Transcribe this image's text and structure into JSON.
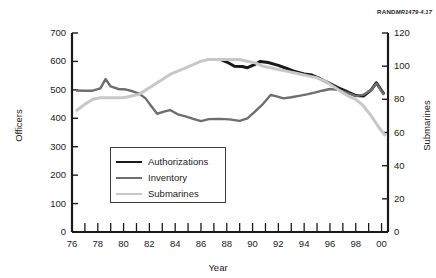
{
  "credit": {
    "mark": "RAND",
    "id": "MR1479-4.17"
  },
  "chart_data": {
    "type": "line",
    "title": "",
    "subtitle": "",
    "xlabel": "Year",
    "ylabel": "Officers",
    "ylabel_right": "Submarines",
    "xlim": [
      76,
      100.5
    ],
    "ylim": [
      0,
      700
    ],
    "ylim_right": [
      0,
      120
    ],
    "grid": false,
    "legend_position": "center-left",
    "x_tick_labels": [
      "76",
      "78",
      "80",
      "82",
      "84",
      "86",
      "88",
      "90",
      "92",
      "94",
      "96",
      "98",
      "00"
    ],
    "x_tick_values": [
      76,
      78,
      80,
      82,
      84,
      86,
      88,
      90,
      92,
      94,
      96,
      98,
      100
    ],
    "x_minor_tick_values": [
      77,
      79,
      81,
      83,
      85,
      87,
      89,
      91,
      93,
      95,
      97,
      99
    ],
    "y_tick_labels_left": [
      "0",
      "100",
      "200",
      "300",
      "400",
      "500",
      "600",
      "700"
    ],
    "y_tick_values_left": [
      0,
      100,
      200,
      300,
      400,
      500,
      600,
      700
    ],
    "y_tick_labels_right": [
      "0",
      "20",
      "40",
      "60",
      "80",
      "100",
      "120"
    ],
    "y_tick_values_right": [
      0,
      20,
      40,
      60,
      80,
      100,
      120
    ],
    "series": [
      {
        "name": "Authorizations",
        "axis": "left",
        "color": "#1a1a1a",
        "width": 3.0,
        "x": [
          86.5,
          87.5,
          88.0,
          88.6,
          89.2,
          89.6,
          90.2,
          90.6,
          91.2,
          92.0,
          92.6,
          93.2,
          94.0,
          94.6,
          95.2,
          96.0,
          96.6,
          97.2,
          98.0,
          98.6,
          99.2,
          99.6,
          100.2
        ],
        "values": [
          607,
          607,
          598,
          583,
          582,
          578,
          590,
          600,
          596,
          586,
          576,
          566,
          556,
          552,
          540,
          522,
          508,
          496,
          480,
          478,
          500,
          525,
          484
        ]
      },
      {
        "name": "Inventory",
        "axis": "left",
        "color": "#6e6e6e",
        "width": 2.4,
        "x": [
          76.3,
          77.0,
          77.6,
          78.2,
          78.6,
          79.0,
          79.6,
          80.2,
          80.7,
          81.2,
          81.7,
          82.2,
          82.6,
          83.2,
          83.6,
          84.2,
          84.8,
          85.4,
          86.0,
          86.6,
          87.4,
          88.2,
          89.0,
          89.6,
          90.2,
          90.8,
          91.4,
          91.8,
          92.4,
          93.0,
          93.6,
          94.2,
          94.8,
          95.4,
          96.0,
          96.6,
          97.2,
          98.0,
          98.6,
          99.2,
          99.6,
          100.2
        ],
        "values": [
          498,
          497,
          497,
          505,
          538,
          512,
          503,
          501,
          495,
          487,
          470,
          440,
          416,
          424,
          429,
          414,
          407,
          398,
          390,
          397,
          398,
          396,
          391,
          400,
          424,
          450,
          482,
          478,
          470,
          474,
          479,
          484,
          490,
          497,
          503,
          500,
          492,
          478,
          483,
          500,
          522,
          483
        ]
      },
      {
        "name": "Submarines",
        "axis": "right",
        "color": "#c8c8c8",
        "width": 3.0,
        "x": [
          76.3,
          77.0,
          77.6,
          78.2,
          78.8,
          79.4,
          80.0,
          80.6,
          81.2,
          81.8,
          82.4,
          83.0,
          83.6,
          84.2,
          84.8,
          85.4,
          86.0,
          86.6,
          87.4,
          88.2,
          89.0,
          89.6,
          90.2,
          90.8,
          91.4,
          92.0,
          92.6,
          93.2,
          93.8,
          94.4,
          95.0,
          95.6,
          96.2,
          96.8,
          97.4,
          98.0,
          98.6,
          99.2,
          99.8,
          100.3
        ],
        "values": [
          73,
          77,
          80,
          81,
          81,
          81,
          81,
          82,
          83,
          86,
          89,
          92,
          95,
          97,
          99,
          101,
          103,
          104,
          104,
          104,
          104,
          103,
          102,
          100,
          99,
          98,
          97,
          96,
          95,
          94,
          93,
          91,
          88,
          85,
          82,
          80,
          76,
          70,
          63,
          58
        ]
      }
    ]
  }
}
